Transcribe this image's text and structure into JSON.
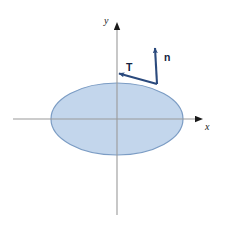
{
  "figure": {
    "width": 228,
    "height": 228,
    "background_color": "#ffffff"
  },
  "colors": {
    "region_fill": "#c3d6ec",
    "region_stroke": "#7b9cc4",
    "axis_line": "#9a9a9a",
    "axis_arrow": "#1a1a1a",
    "vector": "#2b4a7d",
    "label_text": "#13233f"
  },
  "axes": {
    "x_axis": {
      "label": "x",
      "label_x": 205,
      "label_y": 130,
      "line_x1": 13,
      "line_y1": 119,
      "line_x2": 196,
      "line_y2": 119,
      "arrow_tip_x": 203,
      "arrow_tip_y": 119,
      "icon": "axis-arrow-right-icon"
    },
    "y_axis": {
      "label": "y",
      "label_x": 105,
      "label_y": 24,
      "line_x1": 117,
      "line_y1": 215,
      "line_x2": 117,
      "line_y2": 29,
      "arrow_tip_x": 117,
      "arrow_tip_y": 15,
      "icon": "axis-arrow-up-icon"
    },
    "origin": {
      "x": 117,
      "y": 119
    }
  },
  "region": {
    "name": "ellipse-region",
    "shape": "ellipse",
    "center_x": 117,
    "center_y": 119,
    "radius_x": 66,
    "radius_y": 36,
    "fill": "#c3d6ec",
    "stroke": "#7b9cc4",
    "stroke_width": 1.2
  },
  "vectors": [
    {
      "id": "normal-vector",
      "label": "n",
      "meaning": "outward unit normal vector",
      "base_x": 157,
      "base_y": 84,
      "tip_x": 155,
      "tip_y": 46,
      "label_x": 164,
      "label_y": 60,
      "color": "#2b4a7d"
    },
    {
      "id": "tangent-vector",
      "label": "T",
      "meaning": "unit tangent vector",
      "base_x": 157,
      "base_y": 84,
      "tip_x": 117,
      "tip_y": 73,
      "label_x": 126,
      "label_y": 70,
      "color": "#2b4a7d"
    }
  ]
}
